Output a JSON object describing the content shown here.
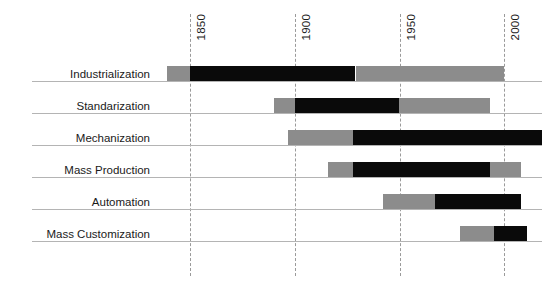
{
  "chart_data": {
    "type": "bar",
    "orientation": "horizontal-timeline",
    "title": "",
    "subtitle": "",
    "xlabel": "",
    "ylabel": "",
    "xlim": [
      1832,
      2022
    ],
    "grid": true,
    "grid_style": "dashed-vertical",
    "legend": null,
    "axis_ticks": [
      {
        "label": "1850",
        "value": 1850
      },
      {
        "label": "1900",
        "value": 1900
      },
      {
        "label": "1950",
        "value": 1950
      },
      {
        "label": "2000",
        "value": 2000
      }
    ],
    "tick_label_rotation": -90,
    "series": [
      {
        "name": "ramp-up",
        "color": "#8c8c8c",
        "description": "light grey leading segment"
      },
      {
        "name": "peak",
        "color": "#0a0a0a",
        "description": "black core segment"
      },
      {
        "name": "decline",
        "color": "#8c8c8c",
        "description": "light grey trailing segment"
      }
    ],
    "categories": [
      "Industrialization",
      "Standarization",
      "Mechanization",
      "Mass Production",
      "Automation",
      "Mass Customization"
    ],
    "rows": [
      {
        "label": "Industrialization",
        "start": 1839,
        "peak_start": 1850,
        "peak_end": 1929,
        "end": 2000,
        "clipped_right": false
      },
      {
        "label": "Standarization",
        "start": 1890,
        "peak_start": 1900,
        "peak_end": 1950,
        "end": 1993,
        "clipped_right": false
      },
      {
        "label": "Mechanization",
        "start": 1897,
        "peak_start": 1928,
        "peak_end": 2018,
        "end": 2018,
        "clipped_right": true
      },
      {
        "label": "Mass Production",
        "start": 1916,
        "peak_start": 1928,
        "peak_end": 1993,
        "end": 2008,
        "clipped_right": false
      },
      {
        "label": "Automation",
        "start": 1942,
        "peak_start": 1967,
        "peak_end": 2008,
        "end": 2008,
        "clipped_right": false
      },
      {
        "label": "Mass Customization",
        "start": 1979,
        "peak_start": 1995,
        "peak_end": 2011,
        "end": 2011,
        "clipped_right": false
      }
    ]
  },
  "style": {
    "grey": "#8c8c8c",
    "black": "#0a0a0a",
    "gridline": "#9a9a9a",
    "baseline": "#b4b4b4",
    "text": "#1a1a1a",
    "background": "#ffffff"
  },
  "geometry": {
    "plot_left_px": 150,
    "plot_right_px": 542,
    "px_per_year": 2.095,
    "origin_year": 1850,
    "origin_px": 190,
    "row_height_px": 32,
    "first_row_top_px": 50
  }
}
